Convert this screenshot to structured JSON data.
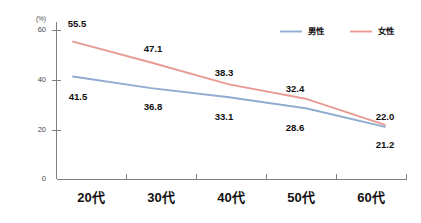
{
  "chart_data": {
    "type": "line",
    "title": "",
    "xlabel": "",
    "ylabel": "",
    "unit_label": "(%)",
    "categories": [
      "20代",
      "30代",
      "40代",
      "50代",
      "60代"
    ],
    "ylim": [
      0,
      65
    ],
    "yticks": [
      0,
      20,
      40,
      60
    ],
    "ytick_labels": [
      "0",
      "20",
      "40",
      "60"
    ],
    "grid": false,
    "legend_position": "top-right",
    "series": [
      {
        "name": "男性",
        "color": "#8FACD1",
        "values": [
          41.5,
          36.8,
          33.1,
          28.6,
          21.2
        ],
        "value_labels": [
          "41.5",
          "36.8",
          "33.1",
          "28.6",
          "21.2"
        ],
        "label_side": "below"
      },
      {
        "name": "女性",
        "color": "#E89A93",
        "values": [
          55.5,
          47.1,
          38.3,
          32.4,
          22.0
        ],
        "value_labels": [
          "55.5",
          "47.1",
          "38.3",
          "32.4",
          "22.0"
        ],
        "label_side": "above"
      }
    ]
  },
  "axes": {
    "axis_color": "#808080",
    "tick_color": "#808080"
  }
}
